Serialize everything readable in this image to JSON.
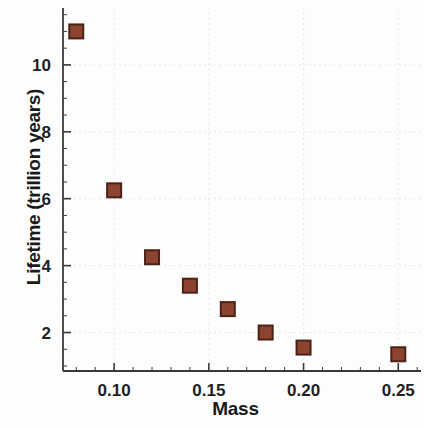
{
  "chart_data": {
    "type": "scatter",
    "title": "",
    "xlabel": "Mass",
    "ylabel": "Lifetime (trillion years)",
    "x": [
      0.08,
      0.1,
      0.12,
      0.14,
      0.16,
      0.18,
      0.2,
      0.25
    ],
    "values": [
      11.0,
      6.25,
      4.25,
      3.4,
      2.7,
      2.0,
      1.55,
      1.35
    ],
    "series": [
      {
        "name": "Lifetime vs Mass",
        "x": [
          0.08,
          0.1,
          0.12,
          0.14,
          0.16,
          0.18,
          0.2,
          0.25
        ],
        "values": [
          11.0,
          6.25,
          4.25,
          3.4,
          2.7,
          2.0,
          1.55,
          1.35
        ]
      }
    ],
    "xlim": [
      0.073,
      0.262
    ],
    "ylim": [
      0.85,
      11.7
    ],
    "xticks": [
      0.1,
      0.15,
      0.2,
      0.25
    ],
    "xtick_labels": [
      "0.10",
      "0.15",
      "0.20",
      "0.25"
    ],
    "yticks": [
      2,
      4,
      6,
      8,
      10
    ],
    "ytick_labels": [
      "2",
      "4",
      "6",
      "8",
      "10"
    ],
    "x_minor_tick_step": 0.01,
    "y_minor_tick_step": 0.5,
    "grid": true,
    "grid_color": "#e8e8e8",
    "legend": null,
    "marker": {
      "shape": "square",
      "fill_color": "#8c4431",
      "edge_color": "#4a2317",
      "size_px": 14
    },
    "axis_color": "#3a3a3a",
    "background_color": "#fdfdfd"
  }
}
